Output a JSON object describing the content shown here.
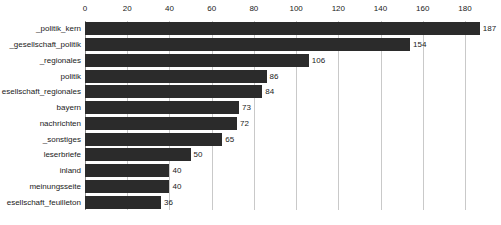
{
  "chart_data": {
    "type": "bar",
    "orientation": "horizontal",
    "title": "",
    "xlabel": "",
    "ylabel": "",
    "xlim": [
      0,
      197
    ],
    "xticks": [
      0,
      20,
      40,
      60,
      80,
      100,
      120,
      140,
      160,
      180
    ],
    "grid": true,
    "axis_position": "top",
    "legend": "none",
    "bar_color": "#2b2b2b",
    "gridline_color": "#c9c9c9",
    "categories": [
      "_politik_kern",
      "_gesellschaft_politik",
      "_regionales",
      "politik",
      "esellschaft_regionales",
      "bayern",
      "nachrichten",
      "_sonstiges",
      "leserbriefe",
      "inland",
      "meinungsseite",
      "esellschaft_feuilleton"
    ],
    "values": [
      187,
      154,
      106,
      86,
      84,
      73,
      72,
      65,
      50,
      40,
      40,
      36
    ],
    "value_labels": [
      "187",
      "154",
      "106",
      "86",
      "84",
      "73",
      "72",
      "65",
      "50",
      "40",
      "40",
      "36"
    ],
    "tick_labels": [
      "0",
      "20",
      "40",
      "60",
      "80",
      "100",
      "120",
      "140",
      "160",
      "180"
    ]
  }
}
